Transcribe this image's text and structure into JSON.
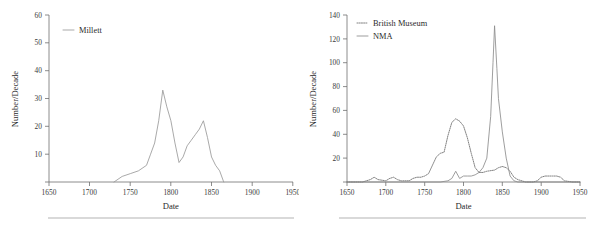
{
  "figure": {
    "panels": [
      {
        "id": "left-panel",
        "axis": {
          "xlabel": "Date",
          "ylabel": "Number/Decade",
          "xticks": [
            "1650",
            "1700",
            "1750",
            "1800",
            "1850",
            "1900",
            "1950"
          ],
          "yticks": [
            "10",
            "20",
            "30",
            "40",
            "50",
            "60"
          ]
        },
        "legend": [
          {
            "label": "Millett",
            "style": "solid"
          }
        ]
      },
      {
        "id": "right-panel",
        "axis": {
          "xlabel": "Date",
          "ylabel": "Number/Decade",
          "xticks": [
            "1650",
            "1700",
            "1750",
            "1800",
            "1850",
            "1900",
            "1950"
          ],
          "yticks": [
            "20",
            "40",
            "60",
            "80",
            "100",
            "120",
            "140"
          ]
        },
        "legend": [
          {
            "label": "British Museum",
            "style": "dotted"
          },
          {
            "label": "NMA",
            "style": "solid"
          }
        ]
      }
    ]
  },
  "chart_data": [
    {
      "type": "line",
      "title": "",
      "xlabel": "Date",
      "ylabel": "Number/Decade",
      "xlim": [
        1650,
        1950
      ],
      "ylim": [
        0,
        60
      ],
      "xticks": [
        1650,
        1700,
        1750,
        1800,
        1850,
        1900,
        1950
      ],
      "yticks": [
        10,
        20,
        30,
        40,
        50,
        60
      ],
      "grid": false,
      "legend_position": "top-left",
      "series": [
        {
          "name": "Millett",
          "style": "solid",
          "color": "#9a9a9a",
          "x": [
            1730,
            1740,
            1750,
            1760,
            1770,
            1775,
            1780,
            1785,
            1790,
            1795,
            1800,
            1805,
            1810,
            1815,
            1820,
            1825,
            1830,
            1835,
            1840,
            1845,
            1850,
            1855,
            1860,
            1865
          ],
          "y": [
            0,
            2,
            3,
            4,
            6,
            10,
            14,
            22,
            33,
            27,
            22,
            14,
            7,
            9,
            13,
            15,
            17,
            19,
            22,
            16,
            9,
            6,
            4,
            0
          ]
        }
      ]
    },
    {
      "type": "line",
      "title": "",
      "xlabel": "Date",
      "ylabel": "Number/Decade",
      "xlim": [
        1650,
        1950
      ],
      "ylim": [
        0,
        140
      ],
      "xticks": [
        1650,
        1700,
        1750,
        1800,
        1850,
        1900,
        1950
      ],
      "yticks": [
        20,
        40,
        60,
        80,
        100,
        120,
        140
      ],
      "grid": false,
      "legend_position": "top-left",
      "series": [
        {
          "name": "British Museum",
          "style": "dotted",
          "color": "#6b6b6b",
          "x": [
            1650,
            1670,
            1680,
            1685,
            1690,
            1700,
            1705,
            1710,
            1715,
            1720,
            1730,
            1735,
            1740,
            1745,
            1750,
            1755,
            1760,
            1765,
            1770,
            1775,
            1780,
            1785,
            1790,
            1795,
            1800,
            1805,
            1810,
            1815,
            1820,
            1825,
            1830,
            1840,
            1845,
            1850,
            1855,
            1860,
            1865,
            1870,
            1880,
            1890,
            1895,
            1900,
            1905,
            1910,
            1915,
            1920,
            1925,
            1930,
            1940,
            1950
          ],
          "y": [
            0,
            0,
            2,
            4,
            2,
            1,
            3,
            4,
            2,
            1,
            1,
            3,
            4,
            4,
            5,
            7,
            14,
            21,
            24,
            25,
            39,
            50,
            53,
            51,
            47,
            37,
            24,
            12,
            8,
            8,
            9,
            10,
            12,
            13,
            12,
            9,
            4,
            2,
            0,
            0,
            1,
            4,
            5,
            5,
            5,
            5,
            4,
            1,
            0,
            0
          ]
        },
        {
          "name": "NMA",
          "style": "solid",
          "color": "#8d8d8d",
          "x": [
            1650,
            1700,
            1750,
            1770,
            1780,
            1785,
            1790,
            1795,
            1800,
            1805,
            1810,
            1815,
            1820,
            1825,
            1830,
            1835,
            1838,
            1840,
            1843,
            1845,
            1850,
            1855,
            1860,
            1865,
            1870,
            1900,
            1950
          ],
          "y": [
            0,
            0,
            0,
            0,
            1,
            3,
            9,
            3,
            5,
            5,
            5,
            6,
            8,
            12,
            20,
            55,
            100,
            131,
            95,
            70,
            42,
            20,
            5,
            1,
            0,
            0,
            0
          ]
        }
      ]
    }
  ]
}
